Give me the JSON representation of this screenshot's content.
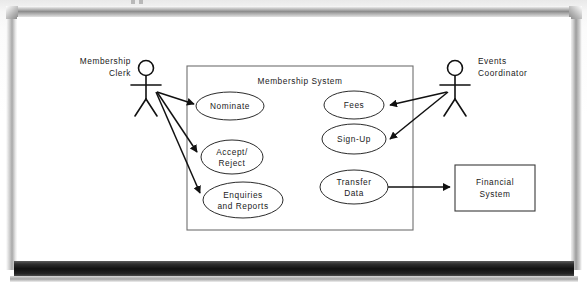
{
  "scene": {
    "medium": "whiteboard",
    "board_surface_color": "#ffffff",
    "frame_color": "#b5b5b5",
    "tray_color": "#171717",
    "ink_color": "#1a1a1a"
  },
  "diagram": {
    "type": "uml-use-case-diagram",
    "system_boundary": {
      "label": "Membership System",
      "x": 187,
      "y": 66,
      "width": 226,
      "height": 164
    },
    "actors": [
      {
        "id": "membership-clerk",
        "label_line1": "Membership",
        "label_line2": "Clerk",
        "x": 146,
        "y": 68,
        "label_anchor": "right"
      },
      {
        "id": "events-coordinator",
        "label_line1": "Events",
        "label_line2": "Coordinator",
        "x": 455,
        "y": 68,
        "label_anchor": "left"
      }
    ],
    "use_cases": [
      {
        "id": "nominate",
        "label_line1": "Nominate",
        "label_line2": "",
        "cx": 230,
        "cy": 106,
        "rx": 34,
        "ry": 14
      },
      {
        "id": "accept-reject",
        "label_line1": "Accept/",
        "label_line2": "Reject",
        "cx": 232,
        "cy": 157,
        "rx": 31,
        "ry": 17
      },
      {
        "id": "enquiries-reports",
        "label_line1": "Enquiries",
        "label_line2": "and Reports",
        "cx": 243,
        "cy": 200,
        "rx": 40,
        "ry": 18
      },
      {
        "id": "fees",
        "label_line1": "Fees",
        "label_line2": "",
        "cx": 354,
        "cy": 105,
        "rx": 30,
        "ry": 14
      },
      {
        "id": "sign-up",
        "label_line1": "Sign-Up",
        "label_line2": "",
        "cx": 354,
        "cy": 139,
        "rx": 32,
        "ry": 15
      },
      {
        "id": "transfer-data",
        "label_line1": "Transfer",
        "label_line2": "Data",
        "cx": 354,
        "cy": 187,
        "rx": 34,
        "ry": 17
      }
    ],
    "external_systems": [
      {
        "id": "financial-system",
        "label_line1": "Financial",
        "label_line2": "System",
        "x": 455,
        "y": 165,
        "width": 80,
        "height": 46
      }
    ],
    "associations": [
      {
        "id": "clerk-to-nominate",
        "from": "membership-clerk",
        "to": "nominate",
        "arrow": "to"
      },
      {
        "id": "clerk-to-accept-reject",
        "from": "membership-clerk",
        "to": "accept-reject",
        "arrow": "to"
      },
      {
        "id": "clerk-to-enquiries",
        "from": "membership-clerk",
        "to": "enquiries-reports",
        "arrow": "to"
      },
      {
        "id": "coordinator-to-fees",
        "from": "events-coordinator",
        "to": "fees",
        "arrow": "to"
      },
      {
        "id": "coordinator-to-sign-up",
        "from": "events-coordinator",
        "to": "sign-up",
        "arrow": "to"
      },
      {
        "id": "transfer-to-financial",
        "from": "transfer-data",
        "to": "financial-system",
        "arrow": "to"
      }
    ]
  }
}
